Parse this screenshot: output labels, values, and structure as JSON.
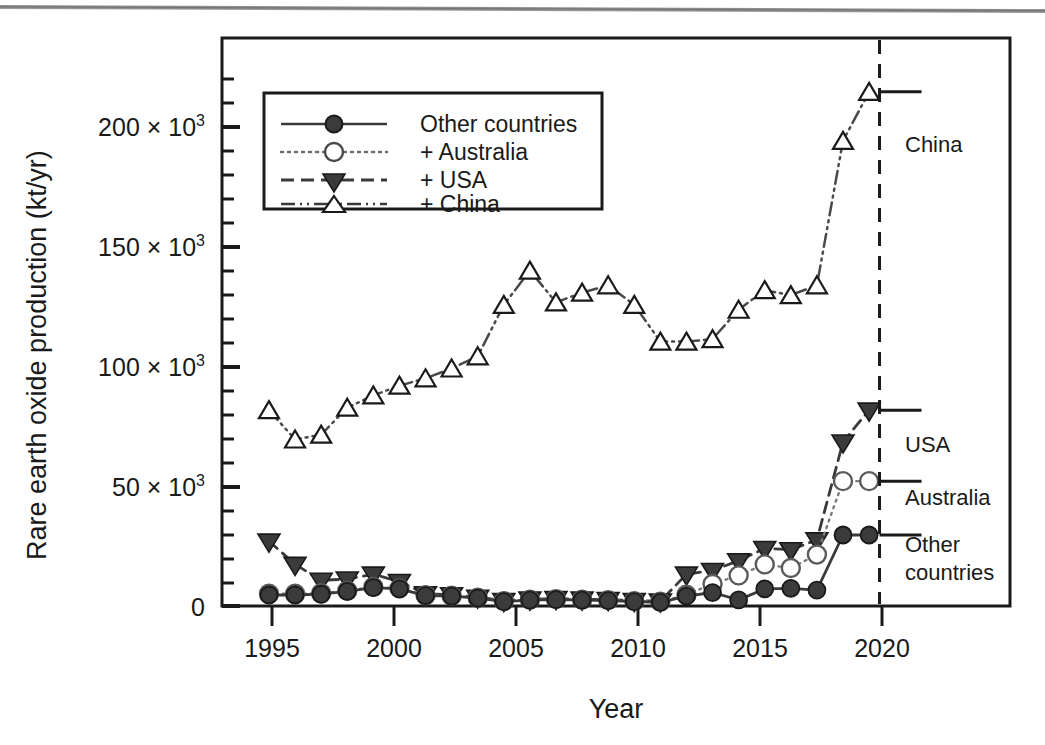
{
  "chart_data": {
    "type": "line",
    "title": "",
    "xlabel": "Year",
    "ylabel": "Rare earth oxide production (kt/yr)",
    "xlim": [
      1994.2,
      2024.4
    ],
    "ylim": [
      0,
      232000
    ],
    "xticks": [
      "1995",
      "2000",
      "2005",
      "2010",
      "2015",
      "2020"
    ],
    "xtick_values": [
      1995,
      2000,
      2005,
      2010,
      2015,
      2020
    ],
    "yticks": [
      "0",
      "50 × 10",
      "100 × 10",
      "150 × 10",
      "200 × 10"
    ],
    "ytick_values": [
      0,
      50000,
      100000,
      150000,
      200000
    ],
    "ytick_exponent": "3",
    "minor_ticks": true,
    "grid": false,
    "legend_position": "upper-left inside",
    "note": "Cumulative / stacked bands: each series is the running total of the one below it.",
    "x": [
      1996,
      1997,
      1998,
      1999,
      2000,
      2001,
      2002,
      2003,
      2004,
      2005,
      2006,
      2007,
      2008,
      2009,
      2010,
      2011,
      2012,
      2013,
      2014,
      2015,
      2016,
      2017,
      2018,
      2019
    ],
    "series": [
      {
        "name": "Other countries",
        "marker": "filled-circle",
        "line": "solid",
        "values": [
          4500,
          4500,
          4800,
          6000,
          7500,
          7000,
          4200,
          4000,
          3200,
          1800,
          2400,
          2600,
          2400,
          2200,
          1800,
          1500,
          4000,
          5500,
          2500,
          7000,
          7200,
          6500,
          29000,
          29000
        ]
      },
      {
        "name": "+ Australia",
        "marker": "open-circle",
        "line": "dotted",
        "values": [
          5000,
          5000,
          5200,
          6200,
          7800,
          7200,
          4400,
          4200,
          3400,
          2000,
          2600,
          2800,
          2600,
          2400,
          2000,
          1800,
          4600,
          9000,
          12500,
          17000,
          15500,
          21000,
          51000,
          51000
        ]
      },
      {
        "name": "+ USA",
        "marker": "filled-triangle-down",
        "line": "dashed",
        "values": [
          26500,
          17000,
          10500,
          11000,
          13000,
          10000,
          5000,
          4600,
          3600,
          2200,
          2800,
          3000,
          2800,
          2600,
          2200,
          2000,
          13000,
          14500,
          18500,
          23500,
          23000,
          27000,
          67000,
          80000
        ]
      },
      {
        "name": "+ China",
        "marker": "open-triangle-up",
        "line": "dash-dot-dot",
        "values": [
          80000,
          68000,
          70000,
          81000,
          86000,
          90000,
          93000,
          97000,
          102000,
          123000,
          137000,
          124000,
          128000,
          131000,
          123000,
          108000,
          108000,
          109000,
          121000,
          129000,
          127000,
          131000,
          190000,
          210000
        ]
      }
    ],
    "band_annotations": [
      {
        "label": "China",
        "value_at": 210000,
        "bracket_from": 80000,
        "bracket_to": 210000
      },
      {
        "label": "USA",
        "value_at": 80000,
        "bracket_from": 51000,
        "bracket_to": 80000
      },
      {
        "label": "Australia",
        "value_at": 51000,
        "bracket_from": 29000,
        "bracket_to": 51000
      },
      {
        "label": "Other\ncountries",
        "value_at": 29000,
        "bracket_from": 0,
        "bracket_to": 29000
      }
    ],
    "divider_year": 2019.4
  },
  "legend": {
    "items": [
      {
        "label": "Other countries",
        "marker": "filled-circle",
        "line": "solid"
      },
      {
        "label": "+ Australia",
        "marker": "open-circle",
        "line": "dotted"
      },
      {
        "label": "+ USA",
        "marker": "filled-triangle-down",
        "line": "dashed"
      },
      {
        "label": "+ China",
        "marker": "open-triangle-up",
        "line": "dash-dot-dot"
      }
    ]
  },
  "axes": {
    "y_title": "Rare earth oxide production (kt/yr)",
    "x_title": "Year",
    "y_tick_labels": [
      {
        "mantissa": "200 × 10",
        "exp": "3"
      },
      {
        "mantissa": "150 × 10",
        "exp": "3"
      },
      {
        "mantissa": "100 × 10",
        "exp": "3"
      },
      {
        "mantissa": "50 × 10",
        "exp": "3"
      },
      {
        "mantissa": "0",
        "exp": ""
      }
    ],
    "x_tick_labels": [
      "1995",
      "2000",
      "2005",
      "2010",
      "2015",
      "2020"
    ]
  },
  "annotations": {
    "china": "China",
    "usa": "USA",
    "australia": "Australia",
    "other_line1": "Other",
    "other_line2": "countries"
  },
  "colors": {
    "ink": "#1a1a1a",
    "line": "#3a3a3a",
    "marker_fill": "#3b3b3b",
    "marker_open": "#ffffff",
    "background": "#ffffff",
    "scan_rule": "#6a6a6a"
  }
}
